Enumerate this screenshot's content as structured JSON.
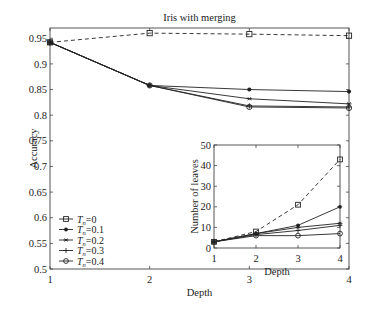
{
  "chart_data": [
    {
      "type": "line",
      "title": "Iris with merging",
      "xlabel": "Depth",
      "ylabel": "Accuracy",
      "x": [
        1,
        2,
        3,
        4
      ],
      "xticks": [
        "1",
        "2",
        "3",
        "4"
      ],
      "yticks": [
        "0.5",
        "0.55",
        "0.6",
        "0.65",
        "0.7",
        "0.75",
        "0.8",
        "0.85",
        "0.9",
        "0.95"
      ],
      "ylim": [
        0.5,
        0.97
      ],
      "xlim": [
        1,
        4
      ],
      "grid": false,
      "legend_position": "lower left",
      "series": [
        {
          "name": "T_n=0",
          "marker": "square",
          "dash": true,
          "values": [
            0.942,
            0.96,
            0.958,
            0.955
          ]
        },
        {
          "name": "T_n=0.1",
          "marker": "star",
          "dash": false,
          "values": [
            0.942,
            0.858,
            0.85,
            0.846
          ]
        },
        {
          "name": "T_n=0.2",
          "marker": "x",
          "dash": false,
          "values": [
            0.942,
            0.858,
            0.832,
            0.822
          ]
        },
        {
          "name": "T_n=0.3",
          "marker": "plus",
          "dash": false,
          "values": [
            0.942,
            0.858,
            0.818,
            0.816
          ]
        },
        {
          "name": "T_n=0.4",
          "marker": "circle",
          "dash": false,
          "values": [
            0.942,
            0.858,
            0.816,
            0.814
          ]
        }
      ]
    },
    {
      "type": "line",
      "title": "",
      "xlabel": "Depth",
      "ylabel": "Number of leaves",
      "x": [
        1,
        2,
        3,
        4
      ],
      "xticks": [
        "1",
        "2",
        "3",
        "4"
      ],
      "yticks": [
        "0",
        "10",
        "20",
        "30",
        "40",
        "50"
      ],
      "ylim": [
        0,
        50
      ],
      "xlim": [
        1,
        4
      ],
      "grid": false,
      "inset": true,
      "series": [
        {
          "name": "T_n=0",
          "marker": "square",
          "dash": true,
          "values": [
            3,
            8,
            21,
            43
          ]
        },
        {
          "name": "T_n=0.1",
          "marker": "star",
          "dash": false,
          "values": [
            3,
            7,
            11,
            20
          ]
        },
        {
          "name": "T_n=0.2",
          "marker": "x",
          "dash": false,
          "values": [
            3,
            7,
            10,
            12
          ]
        },
        {
          "name": "T_n=0.3",
          "marker": "plus",
          "dash": false,
          "values": [
            3,
            6.5,
            8.5,
            11
          ]
        },
        {
          "name": "T_n=0.4",
          "marker": "circle",
          "dash": false,
          "values": [
            3,
            6,
            6,
            7
          ]
        }
      ]
    }
  ],
  "legend": [
    {
      "label": "=0"
    },
    {
      "label": "=0.1"
    },
    {
      "label": "=0.2"
    },
    {
      "label": "=0.3"
    },
    {
      "label": "=0.4"
    }
  ],
  "legend_symbol": "T",
  "legend_subscript": "n"
}
